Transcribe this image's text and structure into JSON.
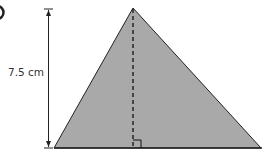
{
  "question_marker": "",
  "figure": {
    "shape": "triangle",
    "fill_color": "#a9a9a9",
    "stroke_color": "#222222",
    "height_label": "7.5 cm",
    "has_dashed_altitude": true,
    "has_right_angle_mark": true
  }
}
